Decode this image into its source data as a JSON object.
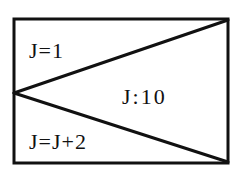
{
  "diagram": {
    "type": "nassi-shneiderman-loop-block",
    "colors": {
      "line": "#111111",
      "background": "#ffffff",
      "text": "#111111"
    },
    "labels": {
      "initialization": "J=1",
      "condition": "J:10",
      "increment": "J=J+2"
    }
  }
}
